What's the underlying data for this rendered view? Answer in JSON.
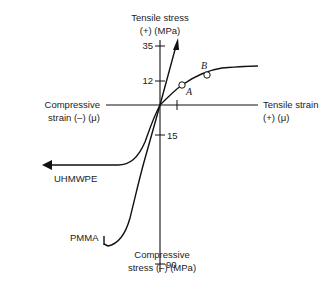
{
  "figure": {
    "axes": {
      "y_top_label_line1": "Tensile stress",
      "y_top_label_line2": "(+) (MPa)",
      "y_bottom_label_line1": "Compressive",
      "y_bottom_label_line2": "stress (–) (MPa)",
      "x_right_label_line1": "Tensile strain",
      "x_right_label_line2": "(+) (μ)",
      "x_left_label_line1": "Compressive",
      "x_left_label_line2": "strain (–) (μ)"
    },
    "ticks": {
      "t35": "35",
      "t12": "12",
      "t15": "15",
      "t90": "90"
    },
    "points": {
      "a": "A",
      "b": "B"
    },
    "curves": {
      "uhmwpe": "UHMWPE",
      "pmma": "PMMA"
    },
    "colors": {
      "line": "#111111",
      "text": "#222222",
      "background": "#ffffff"
    }
  }
}
